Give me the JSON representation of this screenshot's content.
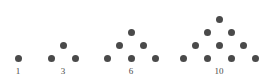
{
  "figure": {
    "background_color": "#ffffff",
    "dot_color": "#4a4a4a",
    "label_color": "#4a4a4a",
    "dot_diameter_px": 7,
    "row_spacing_px": 13,
    "column_spacing_px": 24,
    "groups": [
      {
        "label": "1",
        "rows": 1,
        "count": 1,
        "label_x": 18,
        "label_y": 66,
        "dots": [
          {
            "cx": 18,
            "cy": 58
          }
        ]
      },
      {
        "label": "3",
        "rows": 2,
        "count": 3,
        "label_x": 63,
        "label_y": 66,
        "dots": [
          {
            "cx": 63,
            "cy": 45
          },
          {
            "cx": 51,
            "cy": 58
          },
          {
            "cx": 75,
            "cy": 58
          }
        ]
      },
      {
        "label": "6",
        "rows": 3,
        "count": 6,
        "label_x": 131,
        "label_y": 66,
        "dots": [
          {
            "cx": 131,
            "cy": 32
          },
          {
            "cx": 119,
            "cy": 45
          },
          {
            "cx": 143,
            "cy": 45
          },
          {
            "cx": 107,
            "cy": 58
          },
          {
            "cx": 131,
            "cy": 58
          },
          {
            "cx": 155,
            "cy": 58
          }
        ]
      },
      {
        "label": "10",
        "rows": 4,
        "count": 10,
        "label_x": 219,
        "label_y": 66,
        "dots": [
          {
            "cx": 219,
            "cy": 19
          },
          {
            "cx": 207,
            "cy": 32
          },
          {
            "cx": 231,
            "cy": 32
          },
          {
            "cx": 195,
            "cy": 45
          },
          {
            "cx": 219,
            "cy": 45
          },
          {
            "cx": 243,
            "cy": 45
          },
          {
            "cx": 183,
            "cy": 58
          },
          {
            "cx": 207,
            "cy": 58
          },
          {
            "cx": 231,
            "cy": 58
          },
          {
            "cx": 255,
            "cy": 58
          }
        ]
      }
    ]
  },
  "chart_data": {
    "type": "scatter",
    "categories": [
      "1",
      "3",
      "6",
      "10"
    ],
    "values": [
      1,
      3,
      6,
      10
    ],
    "series": [
      {
        "name": "Triangular number",
        "values": [
          1,
          3,
          6,
          10
        ]
      },
      {
        "name": "Rows in triangle",
        "values": [
          1,
          2,
          3,
          4
        ]
      }
    ],
    "xlabel": "",
    "ylabel": "",
    "grid": false,
    "legend": "none",
    "annotations": [
      "1",
      "3",
      "6",
      "10"
    ]
  }
}
